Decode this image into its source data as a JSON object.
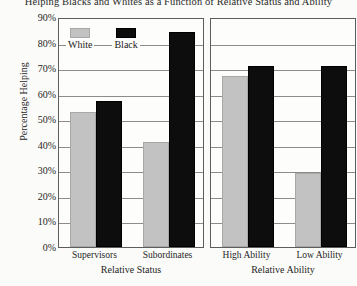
{
  "chart_data": {
    "type": "bar",
    "title": "Helping Blacks and Whites as a Function of Relative Status and Ability",
    "ylabel": "Percentage Helping",
    "ylim": [
      0,
      90
    ],
    "ytick_labels": [
      "90%",
      "80%",
      "70%",
      "60%",
      "50%",
      "40%",
      "30%",
      "20%",
      "10%",
      "0%"
    ],
    "ytick_values": [
      90,
      80,
      70,
      60,
      50,
      40,
      30,
      20,
      10,
      0
    ],
    "grid": "horizontal",
    "legend_position": "inside-top-left-panel",
    "legend": [
      {
        "name": "White",
        "color": "#c2c2c2"
      },
      {
        "name": "Black",
        "color": "#0d0d0d"
      }
    ],
    "panels": [
      {
        "xlabel": "Relative Status",
        "categories": [
          "Supervisors",
          "Subordinates"
        ],
        "series": [
          {
            "name": "White",
            "color": "#c2c2c2",
            "values": [
              53,
              41
            ]
          },
          {
            "name": "Black",
            "color": "#0d0d0d",
            "values": [
              57,
              84
            ]
          }
        ]
      },
      {
        "xlabel": "Relative Ability",
        "categories": [
          "High Ability",
          "Low Ability"
        ],
        "series": [
          {
            "name": "White",
            "color": "#c2c2c2",
            "values": [
              67,
              29
            ]
          },
          {
            "name": "Black",
            "color": "#0d0d0d",
            "values": [
              71,
              71
            ]
          }
        ]
      }
    ]
  }
}
